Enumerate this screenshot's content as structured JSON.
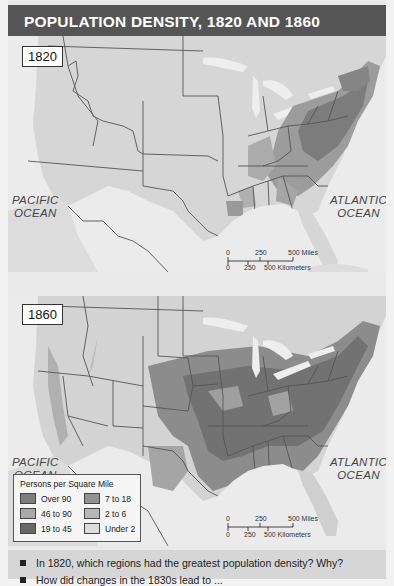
{
  "title": "POPULATION DENSITY, 1820 AND 1860",
  "maps": [
    {
      "year": "1820",
      "oceans": [
        {
          "name": "PACIFIC",
          "sub": "OCEAN"
        },
        {
          "name": "ATLANTIC",
          "sub": "OCEAN"
        }
      ],
      "scale": {
        "miles": [
          "0",
          "250",
          "500 Miles"
        ],
        "km": [
          "0",
          "250",
          "500 Kilometers"
        ]
      }
    },
    {
      "year": "1860",
      "oceans": [
        {
          "name": "PACIFIC",
          "sub": "OCEAN"
        },
        {
          "name": "ATLANTIC",
          "sub": "OCEAN"
        }
      ],
      "scale": {
        "miles": [
          "0",
          "250",
          "500 Miles"
        ],
        "km": [
          "0",
          "250",
          "500 Kilometers"
        ]
      }
    }
  ],
  "legend": {
    "title": "Persons per Square Mile",
    "items": [
      {
        "label": "Over 90",
        "color": "#7d7d7d"
      },
      {
        "label": "46 to 90",
        "color": "#a9a9a9"
      },
      {
        "label": "19 to 45",
        "color": "#686868"
      },
      {
        "label": "7 to 18",
        "color": "#939393"
      },
      {
        "label": "2 to 6",
        "color": "#b8b8b8"
      },
      {
        "label": "Under 2",
        "color": "#dcdcdc"
      }
    ]
  },
  "questions": [
    "In 1820, which regions had the greatest population density? Why?",
    "How did changes in the 1830s lead to ..."
  ],
  "colors": {
    "title_bg": "#555555",
    "land": "#d8d8d8",
    "water": "#ebebeb",
    "border": "#555555",
    "dense": "#7a7a7a",
    "medium": "#9a9a9a",
    "light": "#b5b5b5",
    "question_bg": "#d6d6d6"
  }
}
